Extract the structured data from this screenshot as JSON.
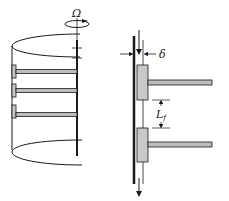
{
  "diagram": {
    "left_figure": {
      "rotation_label": "Ω",
      "fins": 3
    },
    "right_figure": {
      "thickness_label": "δ",
      "spacing_label_main": "L",
      "spacing_label_sub": "f"
    },
    "colors": {
      "line": "#1a1a1a",
      "fin_fill": "#bdbdbd",
      "block_fill": "#c8c8c8",
      "background": "#ffffff"
    }
  }
}
